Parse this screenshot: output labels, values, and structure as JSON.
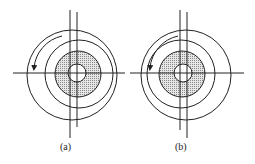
{
  "figures": [
    {
      "id": "a",
      "label": "(a)",
      "description": "Eccentric inner shaded disk offset to the right within outer rings; counterclockwise arrow at upper-left"
    },
    {
      "id": "b",
      "label": "(b)",
      "description": "Eccentric inner shaded disk offset to the left within outer rings; counterclockwise arrow at upper-left"
    }
  ],
  "colors": {
    "stroke": "#222222",
    "fill_dots": "#9a9a9a",
    "background": "#ffffff"
  }
}
